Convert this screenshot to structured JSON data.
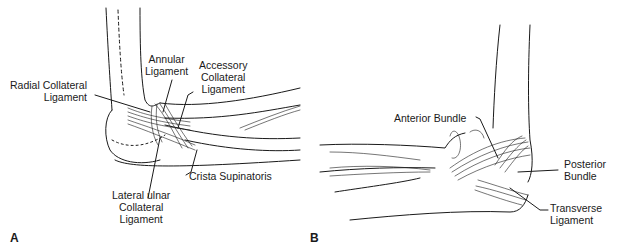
{
  "figure": {
    "panel_a": {
      "letter": "A",
      "view": "lateral elbow",
      "labels": {
        "radial_collateral": [
          "Radial Collateral",
          "Ligament"
        ],
        "annular": [
          "Annular",
          "Ligament"
        ],
        "accessory_collateral": [
          "Accessory",
          "Collateral",
          "Ligament"
        ],
        "crista_supinatoris": [
          "Crista Supinatoris"
        ],
        "lateral_ulnar_collateral": [
          "Lateral ulnar",
          "Collateral",
          "Ligament"
        ]
      }
    },
    "panel_b": {
      "letter": "B",
      "view": "medial elbow",
      "labels": {
        "anterior_bundle": [
          "Anterior Bundle"
        ],
        "posterior_bundle": [
          "Posterior",
          "Bundle"
        ],
        "transverse": [
          "Transverse",
          "Ligament"
        ]
      }
    },
    "colors": {
      "line": "#1a1a1a",
      "background": "#ffffff"
    }
  }
}
